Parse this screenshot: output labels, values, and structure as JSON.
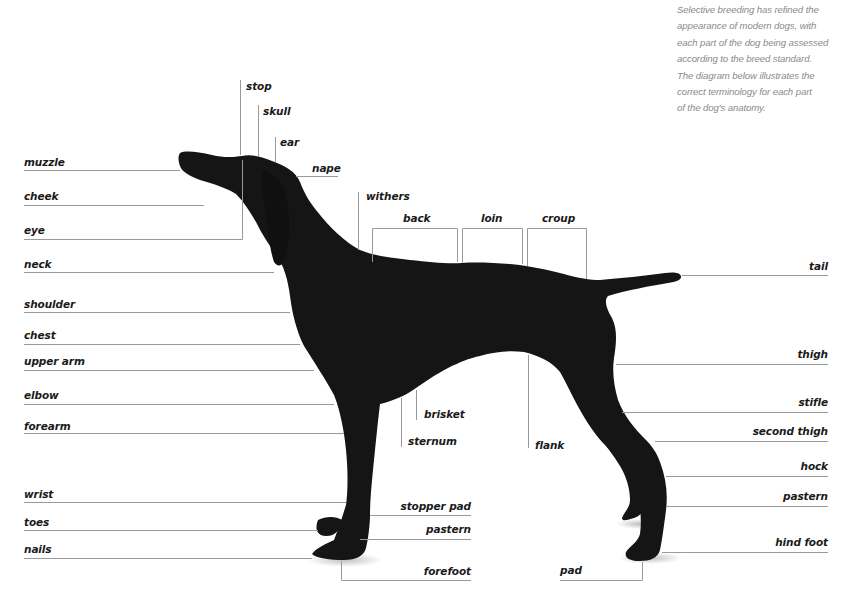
{
  "intro_text": [
    "Selective breeding has refined the",
    "appearance of modern dogs, with",
    "each part of the dog being assessed",
    "according to the breed standard.",
    "The diagram below illustrates the",
    "correct terminology for each part",
    "of the dog's anatomy."
  ],
  "colors": {
    "line": "#9a9a9a",
    "dog": "#151515",
    "label": "#1a1a1a",
    "intro": "#8a8a8a"
  },
  "labels": {
    "left": {
      "muzzle": "muzzle",
      "cheek": "cheek",
      "eye": "eye",
      "neck": "neck",
      "shoulder": "shoulder",
      "chest": "chest",
      "upper_arm": "upper arm",
      "elbow": "elbow",
      "forearm": "forearm",
      "wrist": "wrist",
      "toes": "toes",
      "nails": "nails"
    },
    "top": {
      "stop": "stop",
      "skull": "skull",
      "ear": "ear",
      "nape": "nape",
      "withers": "withers",
      "back": "back",
      "loin": "loin",
      "croup": "croup"
    },
    "center": {
      "brisket": "brisket",
      "sternum": "sternum",
      "flank": "flank",
      "stopper_pad": "stopper pad",
      "front_pastern": "pastern",
      "forefoot": "forefoot",
      "pad": "pad"
    },
    "right": {
      "tail": "tail",
      "thigh": "thigh",
      "stifle": "stifle",
      "second_thigh": "second thigh",
      "hock": "hock",
      "hind_pastern": "pastern",
      "hind_foot": "hind foot"
    }
  }
}
